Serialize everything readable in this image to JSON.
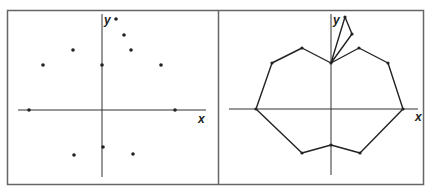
{
  "figure": {
    "panels": [
      {
        "name": "scatter-points",
        "axes": {
          "x_label": "x",
          "y_label": "y"
        },
        "points": [
          [
            -73,
            0
          ],
          [
            -59,
            45
          ],
          [
            -29,
            60
          ],
          [
            0,
            45
          ],
          [
            14,
            91
          ],
          [
            22,
            75
          ],
          [
            29,
            60
          ],
          [
            59,
            45
          ],
          [
            73,
            0
          ],
          [
            1,
            -37
          ],
          [
            -28,
            -45
          ],
          [
            31,
            -44
          ]
        ]
      },
      {
        "name": "connected-apple",
        "axes": {
          "x_label": "x",
          "y_label": "y"
        },
        "outline": [
          [
            -75,
            0
          ],
          [
            -59,
            46
          ],
          [
            -29,
            61
          ],
          [
            0,
            46
          ],
          [
            28,
            61
          ],
          [
            57,
            46
          ],
          [
            72,
            0
          ],
          [
            29,
            -44
          ],
          [
            0,
            -36
          ],
          [
            -29,
            -44
          ],
          [
            -75,
            0
          ]
        ],
        "stem": [
          [
            0,
            46
          ],
          [
            14,
            92
          ],
          [
            21,
            75
          ],
          [
            0,
            46
          ]
        ]
      }
    ]
  },
  "colors": {
    "line": "#222222",
    "frame": "#555555"
  }
}
